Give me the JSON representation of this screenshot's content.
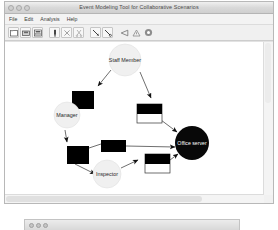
{
  "window": {
    "title": "Event Modeling Tool for Collaborative Scenarios",
    "traffic_lights": [
      "close-button",
      "minimize-button",
      "zoom-button"
    ]
  },
  "menubar": {
    "items": [
      {
        "label": "File",
        "name": "menu-file"
      },
      {
        "label": "Edit",
        "name": "menu-edit"
      },
      {
        "label": "Analysis",
        "name": "menu-analysis"
      },
      {
        "label": "Help",
        "name": "menu-help"
      }
    ]
  },
  "toolbar": {
    "buttons": [
      {
        "name": "new-file-icon",
        "glyph": "□",
        "title": "New"
      },
      {
        "name": "save-icon",
        "glyph": "▬",
        "title": "Save"
      },
      {
        "name": "print-icon",
        "glyph": "▤",
        "title": "Print"
      },
      {
        "name": "place-node-icon",
        "glyph": "❙",
        "title": "Place"
      },
      {
        "name": "delete-icon",
        "glyph": "×",
        "title": "Delete"
      },
      {
        "name": "cut-icon",
        "glyph": "✂",
        "title": "Cut"
      },
      {
        "name": "arc-tool-icon",
        "glyph": "╲",
        "title": "Arc"
      },
      {
        "name": "inhibitor-arc-icon",
        "glyph": "╲",
        "title": "Inhibitor arc"
      },
      {
        "name": "select-arrow-icon",
        "glyph": "◁",
        "title": "Select"
      },
      {
        "name": "warning-icon",
        "glyph": "⚠",
        "title": "Validate"
      },
      {
        "name": "run-icon",
        "glyph": "●",
        "title": "Run"
      }
    ]
  },
  "canvas": {
    "nodes": [
      {
        "id": "staff-member",
        "label": "Staff Member",
        "type": "place",
        "cx": 120,
        "cy": 18,
        "r": 16
      },
      {
        "id": "manager",
        "label": "Manager",
        "type": "place",
        "cx": 62,
        "cy": 73,
        "r": 13
      },
      {
        "id": "inspector",
        "label": "Inspector",
        "type": "place",
        "cx": 102,
        "cy": 132,
        "r": 14
      },
      {
        "id": "office-server",
        "label": "Office server",
        "type": "place-dark",
        "cx": 187,
        "cy": 101,
        "r": 17
      }
    ],
    "transitions": [
      {
        "id": "t1",
        "type": "transition-solid",
        "x": 67,
        "y": 49,
        "w": 22,
        "h": 18
      },
      {
        "id": "t2",
        "type": "transition-split",
        "x": 132,
        "y": 62,
        "w": 25,
        "h": 19
      },
      {
        "id": "t3",
        "type": "transition-solid",
        "x": 96,
        "y": 98,
        "w": 25,
        "h": 12
      },
      {
        "id": "t4",
        "type": "transition-solid",
        "x": 62,
        "y": 104,
        "w": 22,
        "h": 18
      },
      {
        "id": "t5",
        "type": "transition-split",
        "x": 140,
        "y": 112,
        "w": 25,
        "h": 19
      }
    ],
    "arc_count": 10
  },
  "scrollbars": {
    "horizontal": "horizontal-scrollbar",
    "vertical": "vertical-scrollbar"
  },
  "background_window": {
    "traffic_lights": [
      "close-button",
      "minimize-button",
      "zoom-button"
    ]
  },
  "colors": {
    "node_fill": "#f0f0f0",
    "node_dark": "#0a0a0a",
    "transition_fill": "#000000",
    "arc": "#000000",
    "canvas_bg": "#ffffff",
    "chrome": "#f0f0f0"
  }
}
